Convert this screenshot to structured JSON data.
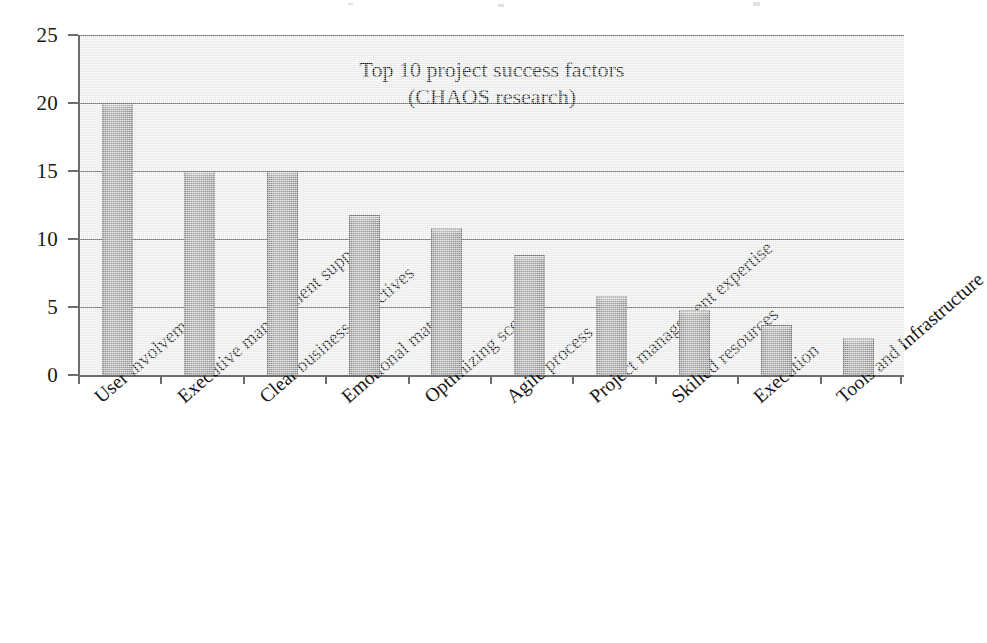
{
  "chart_data": {
    "type": "bar",
    "title": "Top 10 project success factors",
    "subtitle": "(CHAOS research)",
    "xlabel": "",
    "ylabel": "",
    "ylim": [
      0,
      25
    ],
    "ytick_step": 5,
    "ytick_labels": [
      "0",
      "5",
      "10",
      "15",
      "20",
      "25"
    ],
    "grid": true,
    "legend": "none",
    "orientation": "vertical",
    "categories": [
      "User involvement",
      "Executive management support",
      "Clear business objectives",
      "Emotional maturity",
      "Optimizing scope",
      "Agile process",
      "Project management expertise",
      "Skilled resources",
      "Execution",
      "Tools and Infrastructure"
    ],
    "values": [
      20,
      15,
      15,
      11.8,
      10.8,
      8.8,
      5.8,
      4.8,
      3.7,
      2.7
    ],
    "series": [
      {
        "name": "Percentage of responses",
        "values": [
          20,
          15,
          15,
          11.8,
          10.8,
          8.8,
          5.8,
          4.8,
          3.7,
          2.7
        ]
      }
    ]
  },
  "style": {
    "bar_fill": "#9a9a9a",
    "bar_stroke": "#6a6a6a",
    "plot_background": "#e9e9e9",
    "gridline_color": "#6f6f6f",
    "axis_color": "#6d6d6d",
    "text_color": "#151515",
    "page_background": "#ffffff"
  }
}
